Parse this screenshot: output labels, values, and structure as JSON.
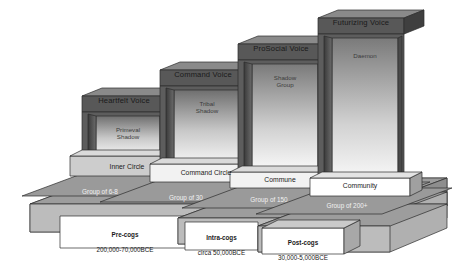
{
  "diagram": {
    "type": "3d-staircase",
    "colors": {
      "page_background": "#ffffff",
      "riser_dark": "#4a4a4a",
      "riser_mid": "#6e6e6e",
      "tread_light": "#d3d3d3",
      "tread_mid": "#bdbdbd",
      "base_top": "#9a9a9a",
      "base_front": "#b5b5b5",
      "label_box": "#ffffff",
      "label_box_gray": "#cfcfcf",
      "outline": "#2b2b2b",
      "text_dark": "#1a1a1a",
      "text_light": "#f2f2f2",
      "interior_gradient_from": "#6f6f6f",
      "interior_gradient_to": "#f4f4f4"
    },
    "steps": [
      {
        "id": "step-1",
        "voice": "Heartfelt Voice",
        "shadow": "Primeval\nShadow",
        "circle": "Inner Circle",
        "group": "Group of 6-8",
        "era_name": "Pre-cogs",
        "era_dates": "200,000-70,000BCE"
      },
      {
        "id": "step-2",
        "voice": "Command Voice",
        "shadow": "Tribal\nShadow",
        "circle": "Command Circle",
        "group": "Group of 30",
        "era_name": "Intra-cogs",
        "era_dates": "circa 50,000BCE"
      },
      {
        "id": "step-3",
        "voice": "ProSocial Voice",
        "shadow": "Shadow\nGroup",
        "circle": "Commune",
        "group": "Group of 150",
        "era_name": "Post-cogs",
        "era_dates": "30,000-5,000BCE"
      },
      {
        "id": "step-4",
        "voice": "Futurizing Voice",
        "shadow": "Daemon",
        "circle": "Community",
        "group": "Group of 200+",
        "era_name": "",
        "era_dates": ""
      }
    ]
  }
}
